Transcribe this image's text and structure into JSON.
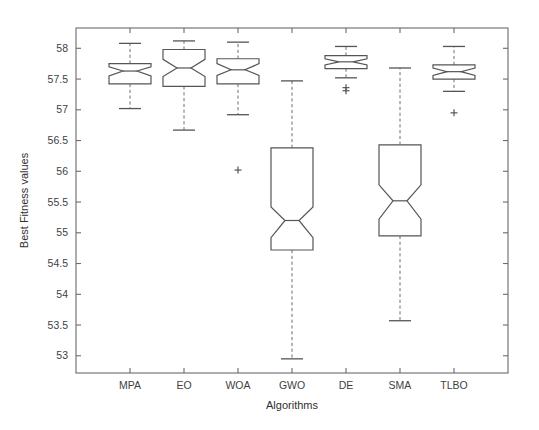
{
  "chart_data": {
    "type": "box",
    "title": "",
    "xlabel": "Algorithms",
    "ylabel": "Best Fitness values",
    "categories": [
      "MPA",
      "EO",
      "WOA",
      "GWO",
      "DE",
      "SMA",
      "TLBO"
    ],
    "ylim": [
      52.72,
      58.33
    ],
    "yticks": [
      53,
      53.5,
      54,
      54.5,
      55,
      55.5,
      56,
      56.5,
      57,
      57.5,
      58
    ],
    "ytick_labels": [
      "53",
      "53.5",
      "54",
      "54.5",
      "55",
      "55.5",
      "56",
      "56.5",
      "57",
      "57.5",
      "58"
    ],
    "grid": false,
    "notched": true,
    "legend": "none",
    "boxes": [
      {
        "name": "MPA",
        "whisker_low": 57.02,
        "q1": 57.42,
        "median": 57.63,
        "q3": 57.75,
        "whisker_high": 58.08,
        "notch_low": 57.55,
        "notch_high": 57.7,
        "outliers": []
      },
      {
        "name": "EO",
        "whisker_low": 56.67,
        "q1": 57.38,
        "median": 57.68,
        "q3": 57.98,
        "whisker_high": 58.12,
        "notch_low": 57.54,
        "notch_high": 57.82,
        "outliers": []
      },
      {
        "name": "WOA",
        "whisker_low": 56.92,
        "q1": 57.42,
        "median": 57.65,
        "q3": 57.83,
        "whisker_high": 58.1,
        "notch_low": 57.56,
        "notch_high": 57.75,
        "outliers": [
          56.02
        ]
      },
      {
        "name": "GWO",
        "whisker_low": 52.95,
        "q1": 54.72,
        "median": 55.2,
        "q3": 56.38,
        "whisker_high": 57.47,
        "notch_low": 54.92,
        "notch_high": 55.42,
        "outliers": []
      },
      {
        "name": "DE",
        "whisker_low": 57.52,
        "q1": 57.67,
        "median": 57.78,
        "q3": 57.88,
        "whisker_high": 58.03,
        "notch_low": 57.73,
        "notch_high": 57.83,
        "outliers": [
          57.36,
          57.31
        ]
      },
      {
        "name": "SMA",
        "whisker_low": 53.57,
        "q1": 54.95,
        "median": 55.52,
        "q3": 56.43,
        "whisker_high": 57.68,
        "notch_low": 55.22,
        "notch_high": 55.78,
        "outliers": []
      },
      {
        "name": "TLBO",
        "whisker_low": 57.3,
        "q1": 57.5,
        "median": 57.62,
        "q3": 57.73,
        "whisker_high": 58.03,
        "notch_low": 57.56,
        "notch_high": 57.68,
        "outliers": [
          56.95
        ]
      }
    ]
  },
  "geometry": {
    "plot_left": 76,
    "plot_right": 508,
    "plot_top": 28,
    "plot_bottom": 373,
    "box_half_width": 21,
    "notch_half_width": 7,
    "cap_half_width": 11
  }
}
